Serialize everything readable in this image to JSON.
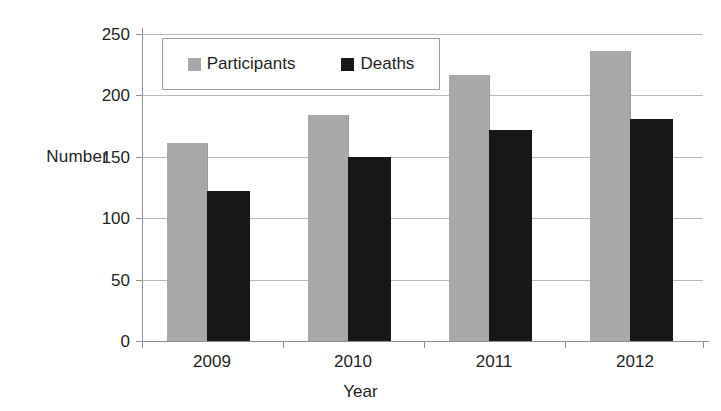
{
  "chart_data": {
    "type": "bar",
    "title": "",
    "xlabel": "Year",
    "ylabel": "Number",
    "categories": [
      "2009",
      "2010",
      "2011",
      "2012"
    ],
    "series": [
      {
        "name": "Participants",
        "color": "#a8a8a8",
        "values": [
          161,
          184,
          217,
          236
        ]
      },
      {
        "name": "Deaths",
        "color": "#171717",
        "values": [
          122,
          150,
          172,
          181
        ]
      }
    ],
    "ylim": [
      0,
      250
    ],
    "ytick_labels": [
      "250",
      "200",
      "150",
      "100",
      "50",
      "0"
    ],
    "ytick_values": [
      250,
      200,
      150,
      100,
      50,
      0
    ],
    "grid": true,
    "legend_position": "top-left-inside"
  },
  "legend": {
    "items": [
      {
        "label": "Participants",
        "swatch": "gray-square-icon"
      },
      {
        "label": "Deaths",
        "swatch": "black-square-icon"
      }
    ]
  },
  "axes": {
    "y_title": "Number",
    "x_title": "Year"
  }
}
